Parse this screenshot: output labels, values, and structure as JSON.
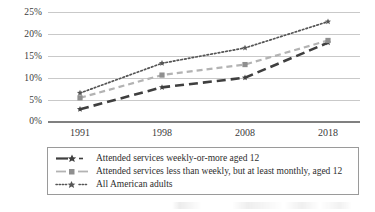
{
  "chart_data": {
    "type": "line",
    "title": "",
    "xlabel": "",
    "ylabel": "",
    "categories": [
      "1991",
      "1998",
      "2008",
      "2018"
    ],
    "ylim": [
      0,
      25
    ],
    "yticks": [
      "0%",
      "5%",
      "10%",
      "15%",
      "20%",
      "25%"
    ],
    "ytick_values": [
      0,
      5,
      10,
      15,
      20,
      25
    ],
    "grid": true,
    "legend_position": "below-plot",
    "series": [
      {
        "name": "Attended services weekly-or-more aged 12",
        "values": [
          2.8,
          7.8,
          10.0,
          18.0
        ],
        "color": "#3f3f3f",
        "style": "long-dash",
        "marker": "star"
      },
      {
        "name": "Attended services less than weekly, but at least monthly, aged 12",
        "values": [
          5.4,
          10.6,
          13.0,
          18.5
        ],
        "color": "#b3b3b3",
        "style": "dash",
        "marker": "square"
      },
      {
        "name": "All American adults",
        "values": [
          6.5,
          13.3,
          16.8,
          22.8
        ],
        "color": "#555555",
        "style": "dotted",
        "marker": "star"
      }
    ]
  },
  "legend": {
    "items": [
      {
        "label": "Attended services weekly-or-more aged 12"
      },
      {
        "label": "Attended services less than weekly, but at least monthly, aged 12"
      },
      {
        "label": "All American adults"
      }
    ]
  }
}
